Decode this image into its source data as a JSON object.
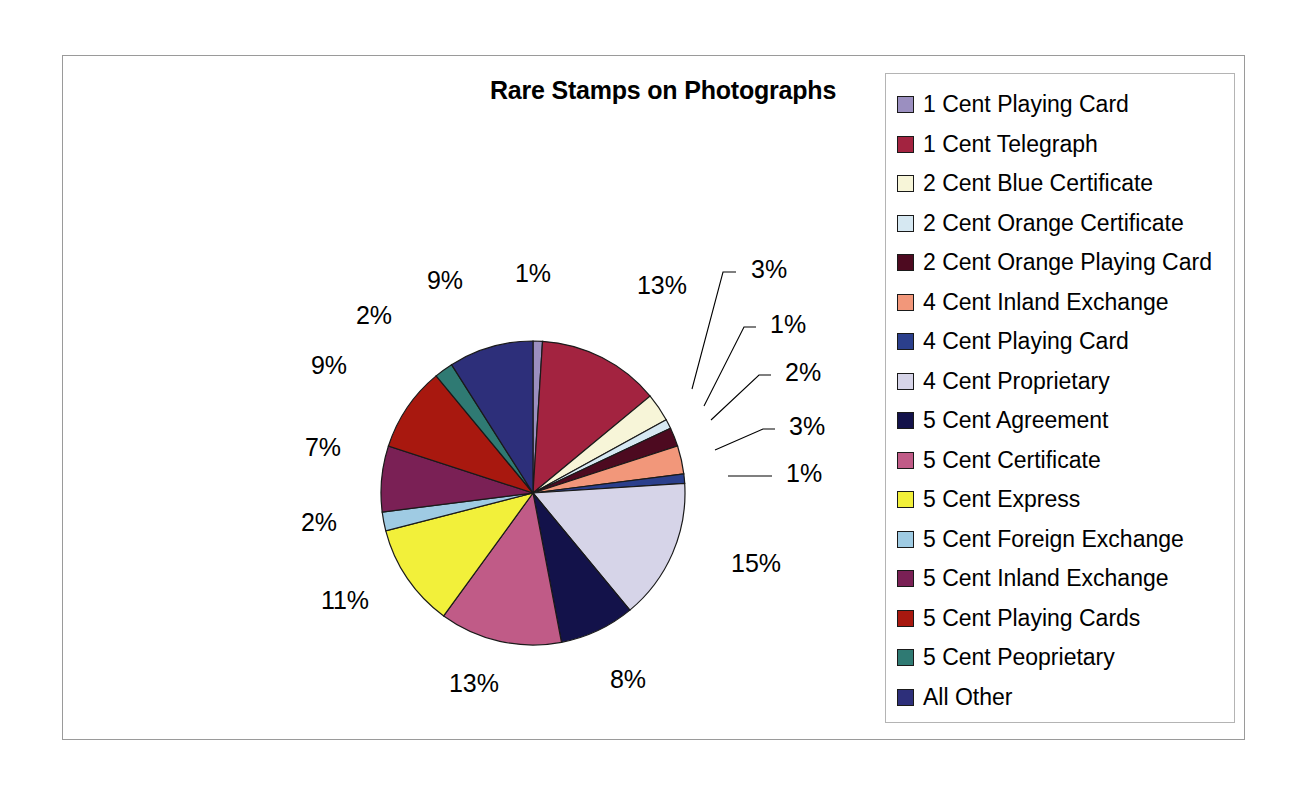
{
  "chart_data": {
    "type": "pie",
    "title": "Rare Stamps on Photographs",
    "legend_position": "right",
    "categories": [
      "1 Cent Playing Card",
      "1 Cent Telegraph",
      "2 Cent Blue Certificate",
      "2 Cent Orange Certificate",
      "2 Cent Orange Playing Card",
      "4 Cent Inland Exchange",
      "4 Cent Playing Card",
      "4 Cent Proprietary",
      "5 Cent Agreement",
      "5 Cent Certificate",
      "5 Cent Express",
      "5 Cent Foreign Exchange",
      "5 Cent Inland Exchange",
      "5 Cent Playing Cards",
      "5 Cent Peoprietary",
      "All Other"
    ],
    "values": [
      1,
      13,
      3,
      1,
      2,
      3,
      1,
      15,
      8,
      13,
      11,
      2,
      7,
      9,
      2,
      9
    ],
    "value_labels": [
      "1%",
      "13%",
      "3%",
      "1%",
      "2%",
      "3%",
      "1%",
      "15%",
      "8%",
      "13%",
      "11%",
      "2%",
      "7%",
      "9%",
      "2%",
      "9%"
    ],
    "colors": [
      "#9b8fc0",
      "#a32340",
      "#f7f5d8",
      "#d6e8f2",
      "#4d0a20",
      "#f2977a",
      "#2b3f8c",
      "#d6d4e8",
      "#13124a",
      "#c05b87",
      "#f2f03a",
      "#9fcbe3",
      "#7a2055",
      "#a8180f",
      "#2f7a73",
      "#2d2f7a"
    ],
    "units": "percent",
    "total": 100
  },
  "legend": {
    "items": [
      {
        "label": "1 Cent Playing Card",
        "color": "#9b8fc0"
      },
      {
        "label": "1 Cent Telegraph",
        "color": "#a32340"
      },
      {
        "label": "2 Cent Blue Certificate",
        "color": "#f7f5d8"
      },
      {
        "label": "2 Cent Orange Certificate",
        "color": "#d6e8f2"
      },
      {
        "label": "2 Cent Orange Playing Card",
        "color": "#4d0a20"
      },
      {
        "label": "4 Cent Inland Exchange",
        "color": "#f2977a"
      },
      {
        "label": "4 Cent Playing Card",
        "color": "#2b3f8c"
      },
      {
        "label": "4 Cent Proprietary",
        "color": "#d6d4e8"
      },
      {
        "label": "5 Cent Agreement",
        "color": "#13124a"
      },
      {
        "label": "5 Cent Certificate",
        "color": "#c05b87"
      },
      {
        "label": "5 Cent Express",
        "color": "#f2f03a"
      },
      {
        "label": "5 Cent Foreign Exchange",
        "color": "#9fcbe3"
      },
      {
        "label": "5 Cent Inland Exchange",
        "color": "#7a2055"
      },
      {
        "label": "5 Cent Playing Cards",
        "color": "#a8180f"
      },
      {
        "label": "5 Cent Peoprietary",
        "color": "#2f7a73"
      },
      {
        "label": "All Other",
        "color": "#2d2f7a"
      }
    ]
  },
  "pie_geometry": {
    "cx": 470,
    "cy": 437,
    "r": 152,
    "start_angle_deg": -90
  },
  "label_placements": [
    {
      "index": 0,
      "text": "1%",
      "x": 470,
      "y": 226,
      "anchor": "middle",
      "leader": false
    },
    {
      "index": 1,
      "text": "13%",
      "x": 599,
      "y": 238,
      "anchor": "middle",
      "leader": false
    },
    {
      "index": 2,
      "text": "3%",
      "x": 688,
      "y": 222,
      "anchor": "start",
      "leader": true,
      "lx1": 673,
      "ly1": 216,
      "lx2": 660,
      "ly2": 216,
      "lx3": 629,
      "ly3": 333
    },
    {
      "index": 3,
      "text": "1%",
      "x": 707,
      "y": 277,
      "anchor": "start",
      "leader": true,
      "lx1": 693,
      "ly1": 271,
      "lx2": 681,
      "ly2": 271,
      "lx3": 641,
      "ly3": 350
    },
    {
      "index": 4,
      "text": "2%",
      "x": 722,
      "y": 325,
      "anchor": "start",
      "leader": true,
      "lx1": 708,
      "ly1": 319,
      "lx2": 696,
      "ly2": 319,
      "lx3": 648,
      "ly3": 364
    },
    {
      "index": 5,
      "text": "3%",
      "x": 726,
      "y": 379,
      "anchor": "start",
      "leader": true,
      "lx1": 712,
      "ly1": 373,
      "lx2": 700,
      "ly2": 373,
      "lx3": 652,
      "ly3": 394
    },
    {
      "index": 6,
      "text": "1%",
      "x": 723,
      "y": 426,
      "anchor": "start",
      "leader": true,
      "lx1": 709,
      "ly1": 420,
      "lx2": 665,
      "ly2": 420,
      "lx3": 665,
      "ly3": 420
    },
    {
      "index": 7,
      "text": "15%",
      "x": 668,
      "y": 516,
      "anchor": "start",
      "leader": false
    },
    {
      "index": 8,
      "text": "8%",
      "x": 565,
      "y": 632,
      "anchor": "middle",
      "leader": false
    },
    {
      "index": 9,
      "text": "13%",
      "x": 411,
      "y": 636,
      "anchor": "middle",
      "leader": false
    },
    {
      "index": 10,
      "text": "11%",
      "x": 282,
      "y": 553,
      "anchor": "middle",
      "leader": false
    },
    {
      "index": 11,
      "text": "2%",
      "x": 256,
      "y": 475,
      "anchor": "middle",
      "leader": false
    },
    {
      "index": 12,
      "text": "7%",
      "x": 260,
      "y": 400,
      "anchor": "middle",
      "leader": false
    },
    {
      "index": 13,
      "text": "9%",
      "x": 266,
      "y": 318,
      "anchor": "middle",
      "leader": false
    },
    {
      "index": 14,
      "text": "2%",
      "x": 311,
      "y": 268,
      "anchor": "middle",
      "leader": false
    },
    {
      "index": 15,
      "text": "9%",
      "x": 382,
      "y": 233,
      "anchor": "middle",
      "leader": false
    }
  ]
}
